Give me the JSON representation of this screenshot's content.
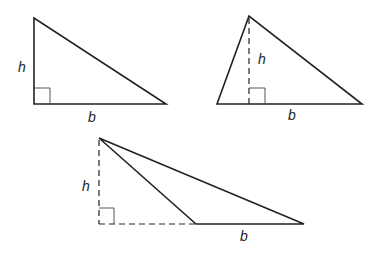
{
  "diagram": {
    "triangles": [
      {
        "id": "right",
        "height_label": "h",
        "base_label": "b"
      },
      {
        "id": "acute",
        "height_label": "h",
        "base_label": "b"
      },
      {
        "id": "obtuse",
        "height_label": "h",
        "base_label": "b"
      }
    ],
    "colors": {
      "stroke": "#222222",
      "background": "#ffffff"
    }
  }
}
